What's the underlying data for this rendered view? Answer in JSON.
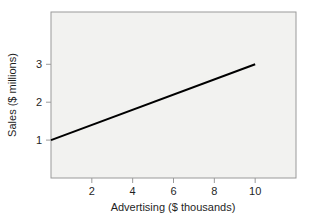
{
  "figure": {
    "background_color": "#ffffff",
    "plot_background_color": "#f2f2f0",
    "frame_color": "#9a9a9a"
  },
  "chart_data": {
    "type": "line",
    "title": "",
    "subtitle": "",
    "xlabel": "Advertising ($ thousands)",
    "ylabel": "Sales ($ millions)",
    "xlim": [
      0,
      12
    ],
    "ylim": [
      0,
      4.38
    ],
    "xticks": [
      2,
      4,
      6,
      8,
      10
    ],
    "xtick_labels": [
      "2",
      "4",
      "6",
      "8",
      "10"
    ],
    "yticks": [
      1,
      2,
      3
    ],
    "ytick_labels": [
      "1",
      "2",
      "3"
    ],
    "grid": false,
    "legend": null,
    "legend_position": "none",
    "series": [
      {
        "name": "Regression line",
        "type": "line",
        "color": "#000000",
        "line_width": 2,
        "x": [
          0,
          10
        ],
        "values": [
          1,
          3
        ],
        "slope": 0.2,
        "intercept": 1
      }
    ],
    "annotations": []
  },
  "axes": {
    "x_title": "Advertising ($ thousands)",
    "y_title": "Sales ($ millions)"
  },
  "ticks": {
    "x": [
      {
        "label": "2",
        "value": 2
      },
      {
        "label": "4",
        "value": 4
      },
      {
        "label": "6",
        "value": 6
      },
      {
        "label": "8",
        "value": 8
      },
      {
        "label": "10",
        "value": 10
      }
    ],
    "y": [
      {
        "label": "1",
        "value": 1
      },
      {
        "label": "2",
        "value": 2
      },
      {
        "label": "3",
        "value": 3
      }
    ]
  }
}
